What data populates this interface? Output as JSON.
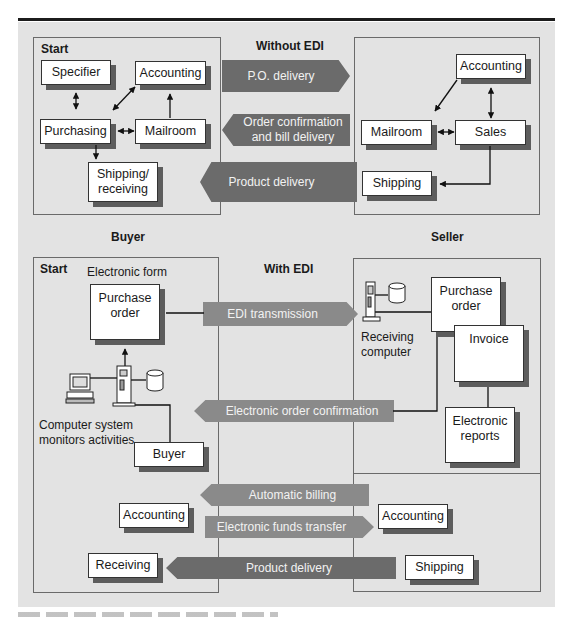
{
  "figure": {
    "top_section": {
      "title": "Without EDI",
      "buyer_box": {
        "start_label": "Start",
        "nodes": {
          "specifier": "Specifier",
          "accounting": "Accounting",
          "purchasing": "Purchasing",
          "mailroom": "Mailroom",
          "shipping_receiving": "Shipping/ receiving"
        }
      },
      "seller_box": {
        "nodes": {
          "accounting": "Accounting",
          "mailroom": "Mailroom",
          "sales": "Sales",
          "shipping": "Shipping"
        }
      },
      "arrows": {
        "po_delivery": "P.O. delivery",
        "order_confirmation": "Order confirmation and bill delivery",
        "product_delivery": "Product delivery"
      }
    },
    "bottom_section": {
      "title": "With EDI",
      "buyer_label": "Buyer",
      "seller_label": "Seller",
      "buyer_box": {
        "start_label": "Start",
        "electronic_form_label": "Electronic form",
        "nodes": {
          "purchase_order": "Purchase order",
          "buyer": "Buyer",
          "accounting": "Accounting",
          "receiving": "Receiving"
        },
        "computer_caption": "Computer system monitors activities"
      },
      "seller_box": {
        "receiving_computer_caption": "Receiving computer",
        "nodes": {
          "purchase_order": "Purchase order",
          "invoice": "Invoice",
          "electronic_reports": "Electronic reports",
          "accounting": "Accounting",
          "shipping": "Shipping"
        }
      },
      "arrows": {
        "edi_transmission": "EDI transmission",
        "electronic_order_confirmation": "Electronic order confirmation",
        "automatic_billing": "Automatic billing",
        "electronic_funds_transfer": "Electronic funds transfer",
        "product_delivery": "Product delivery"
      }
    },
    "colors": {
      "panel_background": "#e3e3e3",
      "arrow_dark": "#6b6b6b",
      "arrow_mid": "#8a8a8a",
      "node_shadow": "#5d5d5d"
    }
  }
}
